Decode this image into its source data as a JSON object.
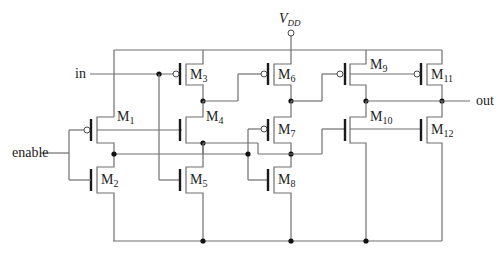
{
  "diagram": {
    "type": "cmos-schematic",
    "supply": {
      "main": "V",
      "sub": "DD"
    },
    "ports": {
      "input": "in",
      "enable": "enable",
      "output": "out"
    },
    "transistors": [
      {
        "id": "M1",
        "main": "M",
        "sub": "1",
        "type": "pmos"
      },
      {
        "id": "M2",
        "main": "M",
        "sub": "2",
        "type": "nmos"
      },
      {
        "id": "M3",
        "main": "M",
        "sub": "3",
        "type": "pmos"
      },
      {
        "id": "M4",
        "main": "M",
        "sub": "4",
        "type": "nmos"
      },
      {
        "id": "M5",
        "main": "M",
        "sub": "5",
        "type": "nmos"
      },
      {
        "id": "M6",
        "main": "M",
        "sub": "6",
        "type": "pmos"
      },
      {
        "id": "M7",
        "main": "M",
        "sub": "7",
        "type": "pmos"
      },
      {
        "id": "M8",
        "main": "M",
        "sub": "8",
        "type": "nmos"
      },
      {
        "id": "M9",
        "main": "M",
        "sub": "9",
        "type": "pmos"
      },
      {
        "id": "M10",
        "main": "M",
        "sub": "10",
        "type": "nmos"
      },
      {
        "id": "M11",
        "main": "M",
        "sub": "11",
        "type": "pmos"
      },
      {
        "id": "M12",
        "main": "M",
        "sub": "12",
        "type": "nmos"
      }
    ]
  }
}
